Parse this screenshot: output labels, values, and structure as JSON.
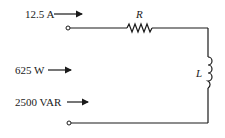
{
  "diagram": {
    "type": "circuit",
    "annotations": {
      "current": "12.5 A",
      "real_power": "625 W",
      "reactive_power": "2500 VAR"
    },
    "components": {
      "resistor": {
        "label": "R"
      },
      "inductor": {
        "label": "L"
      }
    },
    "colors": {
      "ink": "#1a1a1a",
      "background": "#ffffff"
    }
  }
}
